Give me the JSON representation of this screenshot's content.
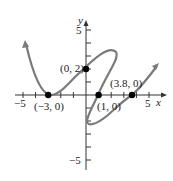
{
  "figure": {
    "axes": {
      "x_label": "x",
      "y_label": "y",
      "x_ticks": {
        "neg5": "−5",
        "pos5": "5"
      },
      "y_ticks": {
        "pos5": "5",
        "neg5": "−5"
      },
      "xlim": [
        -6,
        7
      ],
      "ylim": [
        -6,
        6.5
      ]
    },
    "points": [
      {
        "label": "(0, 2)",
        "x": 0,
        "y": 2
      },
      {
        "label": "(−3, 0)",
        "x": -3,
        "y": 0
      },
      {
        "label": "(1, 0)",
        "x": 1,
        "y": 0
      },
      {
        "label": "(3.8, 0)",
        "x": 3.8,
        "y": 0
      }
    ],
    "curve_color": "#7a7a7a",
    "point_color": "#000000"
  }
}
